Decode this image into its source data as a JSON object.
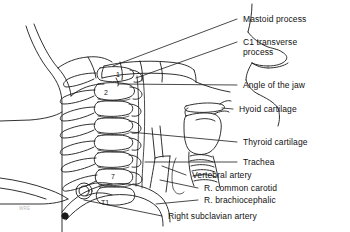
{
  "figure": {
    "background_color": "#ffffff",
    "line_color": "#1a1a1a",
    "text_color": "#111111",
    "watermark_text": "WRE"
  },
  "labels": [
    {
      "id": "mastoid-process",
      "text": "Mastoid process",
      "x": 243,
      "y": 16,
      "leader": "line"
    },
    {
      "id": "c1-transverse-process",
      "text": "C1 transverse",
      "x": 243,
      "y": 39,
      "leader": "line"
    },
    {
      "id": "c1-transverse-process2",
      "text": "process",
      "x": 243,
      "y": 49,
      "leader": "none"
    },
    {
      "id": "angle-of-the-jaw",
      "text": "Angle of the jaw",
      "x": 243,
      "y": 82,
      "leader": "line"
    },
    {
      "id": "hyoid-cartilage",
      "text": "Hyoid cartilage",
      "x": 239,
      "y": 106,
      "leader": "line"
    },
    {
      "id": "thyroid-cartilage",
      "text": "Thyroid cartilage",
      "x": 243,
      "y": 139,
      "leader": "line"
    },
    {
      "id": "trachea",
      "text": "Trachea",
      "x": 243,
      "y": 159,
      "leader": "line"
    },
    {
      "id": "vertebral-artery",
      "text": "Vertebral artery",
      "x": 192,
      "y": 172,
      "leader": "line"
    },
    {
      "id": "r-common-carotid",
      "text": "R. common carotid",
      "x": 204,
      "y": 185,
      "leader": "line"
    },
    {
      "id": "r-brachiocephalic",
      "text": "R. brachiocephalic",
      "x": 204,
      "y": 197,
      "leader": "line"
    },
    {
      "id": "right-subclavian-artery",
      "text": "Right subclavian artery",
      "x": 168,
      "y": 213,
      "leader": "line"
    }
  ],
  "vertebra_marks": [
    {
      "id": "c1",
      "text": "1",
      "x": 118,
      "y": 74
    },
    {
      "id": "c2",
      "text": "2",
      "x": 106,
      "y": 92
    },
    {
      "id": "c7",
      "text": "7",
      "x": 113,
      "y": 176
    },
    {
      "id": "t1",
      "text": "T1",
      "x": 104,
      "y": 202
    }
  ]
}
